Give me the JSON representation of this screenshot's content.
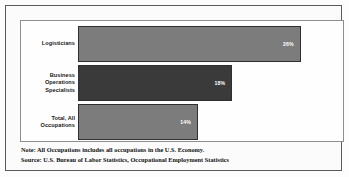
{
  "figure": {
    "background_color": "#fdfdfd",
    "frame_color": "#5a5a5a",
    "panel_border_color": "#8e8e8e"
  },
  "notes": {
    "note_line": "Note: All Occupations includes all occupations in the U.S. Economy.",
    "source_line": "Source: U.S. Bureau of Labor Statistics, Occupational Employment Statistics"
  },
  "chart_data": {
    "type": "bar",
    "orientation": "horizontal",
    "title": "",
    "subtitle": "",
    "xlabel": "",
    "ylabel": "",
    "grid": false,
    "legend": "none",
    "xlim": [
      0,
      30
    ],
    "categories": [
      "Logisticians",
      "Business Operations Specialists",
      "Total, All Occupations"
    ],
    "values": [
      26,
      18,
      14
    ],
    "value_labels": [
      "26%",
      "18%",
      "14%"
    ],
    "bar_colors": [
      "#7c7c7c",
      "#3a3a3a",
      "#7c7c7c"
    ],
    "bar_edge_color": "#2f2f2f",
    "value_label_color": "#ffffff",
    "category_label_color": "#1a1a1a",
    "category_label_lines": [
      [
        "Logisticians"
      ],
      [
        "Business",
        "Operations",
        "Specialists"
      ],
      [
        "Total, All",
        "Occupations"
      ]
    ]
  }
}
